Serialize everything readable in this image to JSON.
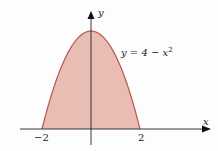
{
  "chart_data": {
    "type": "area",
    "title": "",
    "function": "y = 4 - x^2",
    "xlabel": "x",
    "ylabel": "y",
    "x_tick_labels": [
      "-2",
      "2"
    ],
    "x": [
      -2,
      -1.5,
      -1,
      -0.5,
      0,
      0.5,
      1,
      1.5,
      2
    ],
    "series": [
      {
        "name": "y = 4 - x^2",
        "values": [
          0,
          1.75,
          3,
          3.75,
          4,
          3.75,
          3,
          1.75,
          0
        ]
      }
    ],
    "shaded_region": "area under curve between x=-2 and x=2",
    "xlim": [
      -2.2,
      5
    ],
    "ylim": [
      0,
      4.8
    ],
    "grid": false,
    "annotations": [
      {
        "text": "y = 4 - x²",
        "near": "right side of curve"
      }
    ]
  },
  "labels": {
    "equation_main": "y = 4 − x",
    "equation_exp": "2",
    "y_axis": "y",
    "x_axis": "x",
    "tick_neg": "−2",
    "tick_pos": "2"
  },
  "colors": {
    "fill": "#e9bcb4",
    "curve": "#b5584e",
    "axis": "#222222"
  }
}
